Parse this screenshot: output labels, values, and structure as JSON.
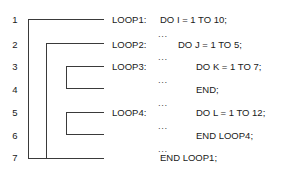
{
  "figure": {
    "line_color": "#3a3a3a",
    "text_color": "#1a1a1a",
    "background": "#ffffff"
  },
  "line_numbers": [
    "1",
    "2",
    "3",
    "4",
    "5",
    "6",
    "7"
  ],
  "loop_labels": [
    {
      "text": "LOOP1:",
      "line": "1"
    },
    {
      "text": "LOOP2:",
      "line": "2"
    },
    {
      "text": "LOOP3:",
      "line": "3"
    },
    {
      "text": "LOOP4:",
      "line": "5"
    }
  ],
  "ellipses": [
    "...",
    "...",
    "...",
    "...",
    "...",
    "..."
  ],
  "code_lines": [
    {
      "text": "DO I = 1 TO 10;",
      "indent": 0,
      "line": "1"
    },
    {
      "text": "DO J = 1 TO 5;",
      "indent": 1,
      "line": "2"
    },
    {
      "text": "DO K = 1 TO 7;",
      "indent": 2,
      "line": "3"
    },
    {
      "text": "END;",
      "indent": 2,
      "line": "4"
    },
    {
      "text": "DO L = 1 TO 12;",
      "indent": 2,
      "line": "5"
    },
    {
      "text": "END LOOP4;",
      "indent": 2,
      "line": "6"
    },
    {
      "text": "END LOOP1;",
      "indent": 0,
      "line": "7"
    }
  ],
  "brackets": [
    {
      "name": "loop1-scope",
      "from_line": "1",
      "to_line": "7"
    },
    {
      "name": "loop2-scope",
      "from_line": "2",
      "to_line": "7"
    },
    {
      "name": "loop3-scope",
      "from_line": "3",
      "to_line": "4"
    },
    {
      "name": "loop4-scope",
      "from_line": "5",
      "to_line": "6"
    }
  ]
}
